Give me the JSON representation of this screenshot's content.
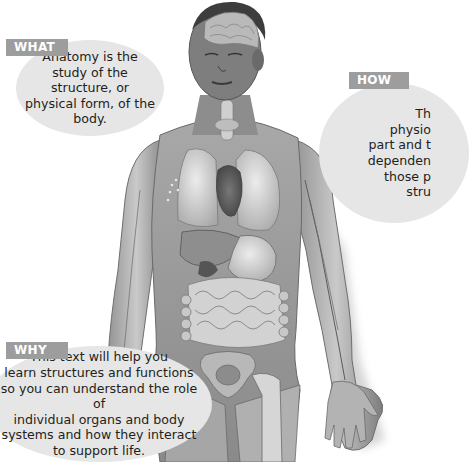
{
  "callouts": {
    "what": {
      "tag": "WHAT",
      "lines": [
        "Anatomy is the",
        "study of the structure, or",
        "physical form, of the",
        "body."
      ]
    },
    "how": {
      "tag": "HOW",
      "lines": [
        "Th",
        "physio",
        "part and t",
        "dependen",
        "those p",
        "stru"
      ]
    },
    "why": {
      "tag": "WHY",
      "lines": [
        "This text will help you",
        "learn structures and functions",
        "so you can understand the role of",
        "individual organs and body",
        "systems and how they interact",
        "to support life."
      ]
    }
  },
  "colors": {
    "bubble": "#e6e6e6",
    "tag": "#9d9d9d",
    "text": "#231f20"
  }
}
